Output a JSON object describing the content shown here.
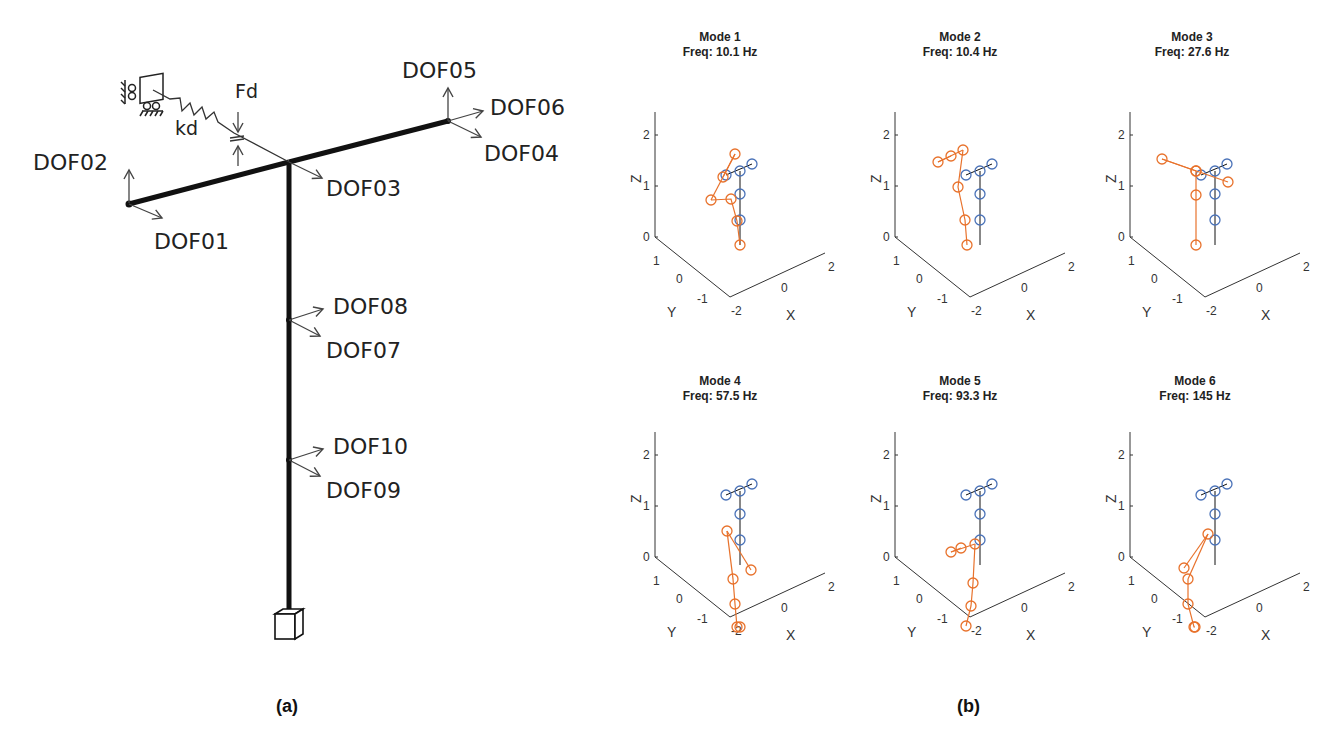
{
  "figure_a": {
    "caption": "(a)",
    "labels": {
      "dof01": "DOF01",
      "dof02": "DOF02",
      "dof03": "DOF03",
      "dof04": "DOF04",
      "dof05": "DOF05",
      "dof06": "DOF06",
      "dof07": "DOF07",
      "dof08": "DOF08",
      "dof09": "DOF09",
      "dof10": "DOF10",
      "damper_force": "Fd",
      "damper_stiffness": "kd"
    }
  },
  "figure_b": {
    "caption": "(b)",
    "colors": {
      "deformed": "#e8722c",
      "undeformed": "#4a72b8",
      "frame": "#111111"
    },
    "axes": {
      "z_label": "Z",
      "y_label": "Y",
      "x_label": "X",
      "z_ticks": [
        "0",
        "1",
        "2"
      ],
      "y_ticks": [
        "1",
        "0",
        "-1"
      ],
      "x_ticks": [
        "-2",
        "0",
        "2"
      ]
    },
    "modes": [
      {
        "title": "Mode 1",
        "freq": "Freq: 10.1 Hz"
      },
      {
        "title": "Mode 2",
        "freq": "Freq: 10.4 Hz"
      },
      {
        "title": "Mode 3",
        "freq": "Freq: 27.6 Hz"
      },
      {
        "title": "Mode 4",
        "freq": "Freq: 57.5 Hz"
      },
      {
        "title": "Mode 5",
        "freq": "Freq: 93.3 Hz"
      },
      {
        "title": "Mode 6",
        "freq": "Freq: 145 Hz"
      }
    ]
  },
  "chart_data": [
    {
      "type": "scatter",
      "title": "Mode 1, Freq: 10.1 Hz",
      "xlabel": "X",
      "ylabel": "Y",
      "zlabel": "Z",
      "zlim": [
        0,
        2.4
      ]
    },
    {
      "type": "scatter",
      "title": "Mode 2, Freq: 10.4 Hz",
      "xlabel": "X",
      "ylabel": "Y",
      "zlabel": "Z",
      "zlim": [
        0,
        2.4
      ]
    },
    {
      "type": "scatter",
      "title": "Mode 3, Freq: 27.6 Hz",
      "xlabel": "X",
      "ylabel": "Y",
      "zlabel": "Z",
      "zlim": [
        0,
        2.4
      ]
    },
    {
      "type": "scatter",
      "title": "Mode 4, Freq: 57.5 Hz",
      "xlabel": "X",
      "ylabel": "Y",
      "zlabel": "Z",
      "zlim": [
        0,
        2.4
      ]
    },
    {
      "type": "scatter",
      "title": "Mode 5, Freq: 93.3 Hz",
      "xlabel": "X",
      "ylabel": "Y",
      "zlabel": "Z",
      "zlim": [
        0,
        2.4
      ]
    },
    {
      "type": "scatter",
      "title": "Mode 6, Freq: 145 Hz",
      "xlabel": "X",
      "ylabel": "Y",
      "zlabel": "Z",
      "zlim": [
        0,
        2.4
      ]
    }
  ]
}
